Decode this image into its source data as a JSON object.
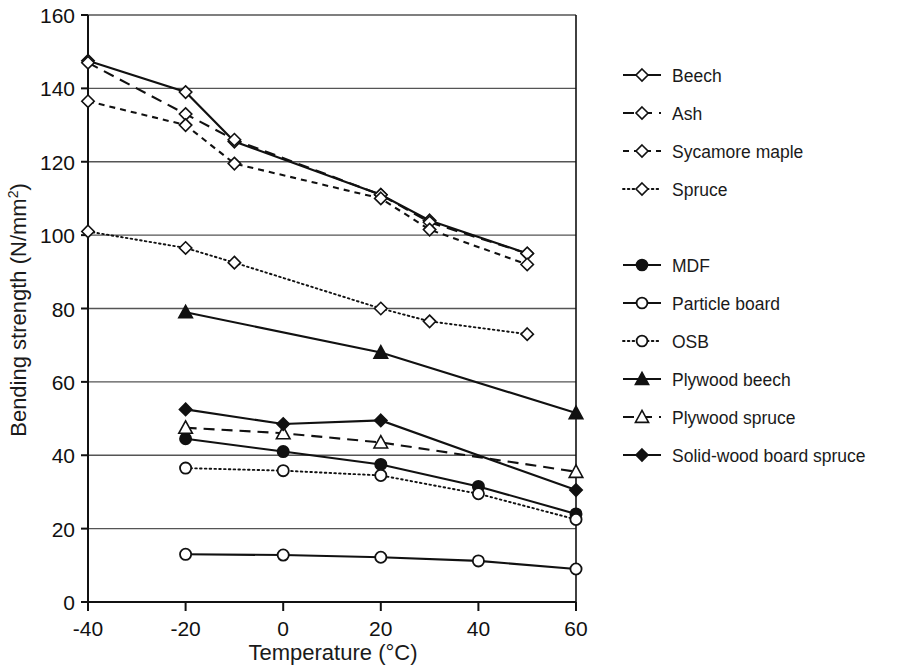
{
  "chart_data": {
    "type": "line",
    "title": "",
    "xlabel": "Temperature (°C)",
    "ylabel": "Bending strength (N/mm²)",
    "xlim": [
      -40,
      60
    ],
    "ylim": [
      0,
      160
    ],
    "xticks": [
      -40,
      -20,
      0,
      20,
      40,
      60
    ],
    "yticks": [
      0,
      20,
      40,
      60,
      80,
      100,
      120,
      140,
      160
    ],
    "grid": "horizontal",
    "legend_position": "right",
    "series": [
      {
        "name": "Beech",
        "marker": "open-diamond",
        "line": "solid",
        "x": [
          -40,
          -20,
          -10,
          20,
          30,
          50
        ],
        "y": [
          147.5,
          139,
          125.5,
          111,
          104,
          95
        ]
      },
      {
        "name": "Ash",
        "marker": "open-diamond",
        "line": "dashed",
        "x": [
          -40,
          -20,
          -10,
          20,
          30,
          50
        ],
        "y": [
          147,
          133,
          126,
          111,
          103.5,
          95
        ]
      },
      {
        "name": "Sycamore maple",
        "marker": "open-diamond",
        "line": "dashed-short",
        "x": [
          -40,
          -20,
          -10,
          20,
          30,
          50
        ],
        "y": [
          136.5,
          130,
          119.5,
          110,
          101.5,
          92
        ]
      },
      {
        "name": "Spruce",
        "marker": "open-diamond",
        "line": "dotted",
        "x": [
          -40,
          -20,
          -10,
          20,
          30,
          50
        ],
        "y": [
          101,
          96.5,
          92.5,
          80,
          76.5,
          73
        ]
      },
      {
        "name": "MDF",
        "marker": "filled-circle",
        "line": "solid",
        "x": [
          -20,
          0,
          20,
          40,
          60
        ],
        "y": [
          44.5,
          41,
          37.5,
          31.5,
          24
        ]
      },
      {
        "name": "Particle board",
        "marker": "open-circle",
        "line": "solid",
        "x": [
          -20,
          0,
          20,
          40,
          60
        ],
        "y": [
          13,
          12.8,
          12.2,
          11.2,
          9
        ]
      },
      {
        "name": "OSB",
        "marker": "open-circle",
        "line": "dotted",
        "x": [
          -20,
          0,
          20,
          40,
          60
        ],
        "y": [
          36.5,
          35.8,
          34.5,
          29.5,
          22.5
        ]
      },
      {
        "name": "Plywood beech",
        "marker": "filled-triangle",
        "line": "solid",
        "x": [
          -20,
          20,
          60
        ],
        "y": [
          79,
          68,
          51.5
        ]
      },
      {
        "name": "Plywood spruce",
        "marker": "open-triangle",
        "line": "dashed",
        "x": [
          -20,
          0,
          20,
          60
        ],
        "y": [
          47.5,
          46,
          43.5,
          35.5
        ]
      },
      {
        "name": "Solid-wood board spruce",
        "marker": "filled-diamond",
        "line": "solid",
        "x": [
          -20,
          0,
          20,
          60
        ],
        "y": [
          52.5,
          48.5,
          49.5,
          30.5
        ]
      }
    ]
  },
  "legend": {
    "groups": [
      {
        "items": [
          "Beech",
          "Ash",
          "Sycamore maple",
          "Spruce"
        ]
      },
      {
        "items": [
          "MDF",
          "Particle board",
          "OSB",
          "Plywood beech",
          "Plywood spruce",
          "Solid-wood board spruce"
        ]
      }
    ]
  },
  "colors": {
    "ink": "#111111",
    "grid": "#555555",
    "axis": "#111111",
    "background": "#ffffff"
  }
}
